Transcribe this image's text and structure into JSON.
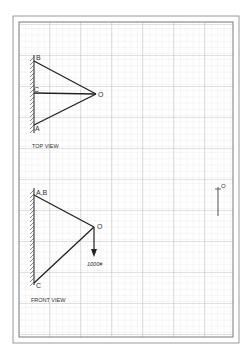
{
  "colors": {
    "background": "#ffffff",
    "grid_fine": "#d9d9d9",
    "grid_heavy": "#b8b8b8",
    "border": "#8a8a8a",
    "ink": "#2a2a2a"
  },
  "top_view": {
    "title": "TOP VIEW",
    "points": {
      "B": {
        "label": "B"
      },
      "C": {
        "label": "C"
      },
      "A": {
        "label": "A"
      },
      "O": {
        "label": "O"
      }
    }
  },
  "front_view": {
    "title": "FRONT VIEW",
    "points": {
      "AB": {
        "label": "A,B"
      },
      "C": {
        "label": "C"
      },
      "O": {
        "label": "O"
      }
    },
    "load": {
      "label": "1000#"
    }
  },
  "side_mark": {
    "label": "O"
  }
}
